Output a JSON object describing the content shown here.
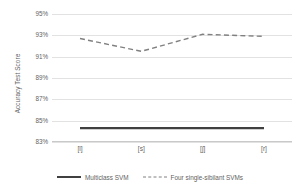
{
  "chart_data": {
    "type": "line",
    "title": "",
    "xlabel": "",
    "ylabel": "Accuracy Test Score",
    "categories": [
      "[l]",
      "[s]",
      "[ʃ]",
      "[r]"
    ],
    "ylim": [
      83,
      95
    ],
    "ytick_values": [
      95,
      93,
      91,
      89,
      87,
      85,
      83
    ],
    "ytick_labels": [
      "95%",
      "93%",
      "91%",
      "89%",
      "87%",
      "85%",
      "83%"
    ],
    "grid": true,
    "legend_position": "bottom",
    "series": [
      {
        "name": "Multiclass SVM",
        "values": [
          84.3,
          84.3,
          84.3,
          84.3
        ],
        "style": "solid",
        "color": "#404040"
      },
      {
        "name": "Four single-sibilant SVMs",
        "values": [
          92.7,
          91.5,
          93.1,
          92.9
        ],
        "style": "dashed",
        "color": "#808080"
      }
    ]
  },
  "axes": {
    "y_title": "Accuracy Test Score",
    "y_ticks": [
      "95%",
      "93%",
      "91%",
      "89%",
      "87%",
      "85%",
      "83%"
    ],
    "x_ticks": [
      "[l]",
      "[s]",
      "[ʃ]",
      "[r]"
    ]
  },
  "legend": {
    "items": [
      {
        "label": "Multiclass SVM",
        "style": "solid",
        "color": "#404040"
      },
      {
        "label": "Four single-sibilant SVMs",
        "style": "dashed",
        "color": "#808080"
      }
    ]
  },
  "colors": {
    "gridline": "#e2e2e2",
    "axis": "#c9c9c9",
    "text": "#5f5f5f",
    "series_solid": "#404040",
    "series_dashed": "#808080",
    "background": "#ffffff"
  }
}
